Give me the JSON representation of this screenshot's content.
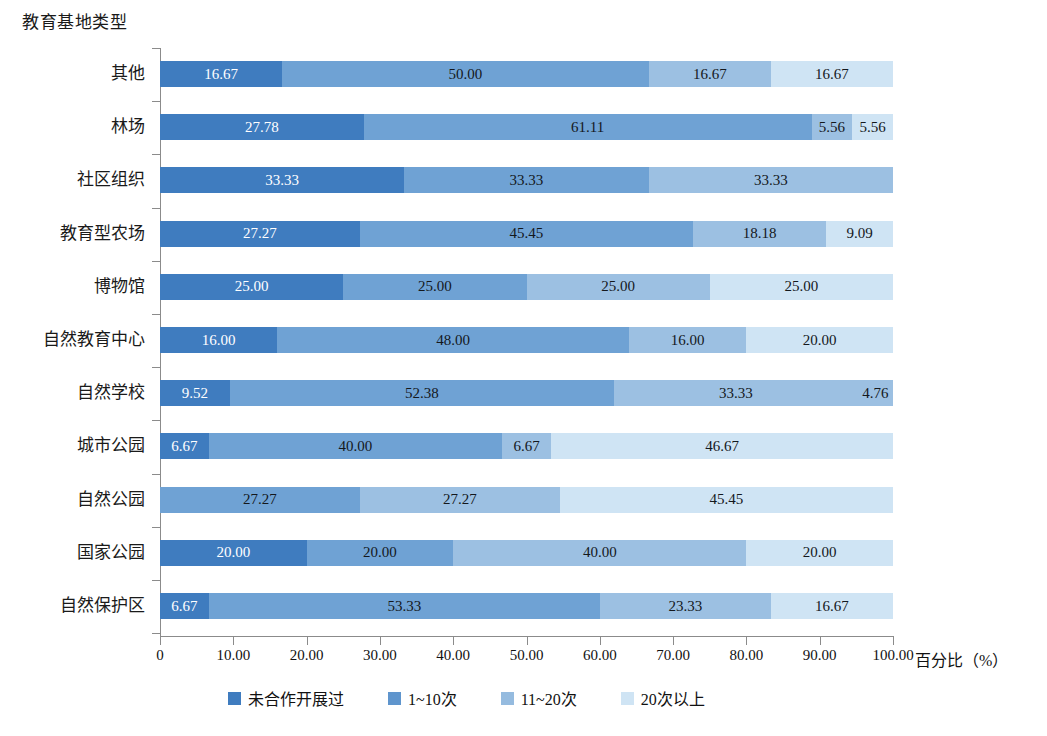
{
  "axis_titles": {
    "y": "教育基地类型",
    "x": "百分比（%）"
  },
  "legend": {
    "items": [
      {
        "label": "未合作开展过",
        "color": "#3f7cbf"
      },
      {
        "label": "1~10次",
        "color": "#5f95cd"
      },
      {
        "label": "11~20次",
        "color": "#95bbdf"
      },
      {
        "label": "20次以上",
        "color": "#cfe4f4"
      }
    ]
  },
  "x_axis": {
    "ticks": [
      "0",
      "10.00",
      "20.00",
      "30.00",
      "40.00",
      "50.00",
      "60.00",
      "70.00",
      "80.00",
      "90.00",
      "100.00"
    ],
    "min": 0,
    "max": 100
  },
  "chart_data": {
    "type": "bar",
    "orientation": "horizontal",
    "stacked": true,
    "title": "",
    "xlabel": "百分比（%）",
    "ylabel": "教育基地类型",
    "xlim": [
      0,
      100
    ],
    "grid": false,
    "legend_position": "bottom",
    "series": [
      {
        "name": "未合作开展过",
        "color": "#3f7cbf"
      },
      {
        "name": "1~10次",
        "color": "#5f95cd"
      },
      {
        "name": "11~20次",
        "color": "#95bbdf"
      },
      {
        "name": "20次以上",
        "color": "#cfe4f4"
      }
    ],
    "categories": [
      "其他",
      "林场",
      "社区组织",
      "教育型农场",
      "博物馆",
      "自然教育中心",
      "自然学校",
      "城市公园",
      "自然公园",
      "国家公园",
      "自然保护区"
    ],
    "rows": [
      {
        "category": "其他",
        "segments": [
          {
            "series": "未合作开展过",
            "value": 16.67,
            "label": "16.67",
            "color": "#3f7cbf",
            "label_color": "light"
          },
          {
            "series": "1~10次",
            "value": 50.0,
            "label": "50.00",
            "color": "#6fa2d4",
            "label_color": "dark"
          },
          {
            "series": "11~20次",
            "value": 16.67,
            "label": "16.67",
            "color": "#9cc0e2",
            "label_color": "dark"
          },
          {
            "series": "20次以上",
            "value": 16.67,
            "label": "16.67",
            "color": "#cfe4f4",
            "label_color": "dark"
          }
        ]
      },
      {
        "category": "林场",
        "segments": [
          {
            "series": "未合作开展过",
            "value": 27.78,
            "label": "27.78",
            "color": "#3f7cbf",
            "label_color": "light"
          },
          {
            "series": "1~10次",
            "value": 61.11,
            "label": "61.11",
            "color": "#6fa2d4",
            "label_color": "dark"
          },
          {
            "series": "11~20次",
            "value": 5.56,
            "label": "5.56",
            "color": "#9cc0e2",
            "label_color": "dark"
          },
          {
            "series": "20次以上",
            "value": 5.56,
            "label": "5.56",
            "color": "#cfe4f4",
            "label_color": "dark"
          }
        ]
      },
      {
        "category": "社区组织",
        "segments": [
          {
            "series": "未合作开展过",
            "value": 33.33,
            "label": "33.33",
            "color": "#3f7cbf",
            "label_color": "light"
          },
          {
            "series": "1~10次",
            "value": 33.33,
            "label": "33.33",
            "color": "#6fa2d4",
            "label_color": "dark"
          },
          {
            "series": "11~20次",
            "value": 33.33,
            "label": "33.33",
            "color": "#9cc0e2",
            "label_color": "dark"
          }
        ]
      },
      {
        "category": "教育型农场",
        "segments": [
          {
            "series": "未合作开展过",
            "value": 27.27,
            "label": "27.27",
            "color": "#3f7cbf",
            "label_color": "light"
          },
          {
            "series": "1~10次",
            "value": 45.45,
            "label": "45.45",
            "color": "#6fa2d4",
            "label_color": "dark"
          },
          {
            "series": "11~20次",
            "value": 18.18,
            "label": "18.18",
            "color": "#9cc0e2",
            "label_color": "dark"
          },
          {
            "series": "20次以上",
            "value": 9.09,
            "label": "9.09",
            "color": "#cfe4f4",
            "label_color": "dark"
          }
        ]
      },
      {
        "category": "博物馆",
        "segments": [
          {
            "series": "未合作开展过",
            "value": 25.0,
            "label": "25.00",
            "color": "#3f7cbf",
            "label_color": "light"
          },
          {
            "series": "1~10次",
            "value": 25.0,
            "label": "25.00",
            "color": "#6fa2d4",
            "label_color": "dark"
          },
          {
            "series": "11~20次",
            "value": 25.0,
            "label": "25.00",
            "color": "#9cc0e2",
            "label_color": "dark"
          },
          {
            "series": "20次以上",
            "value": 25.0,
            "label": "25.00",
            "color": "#cfe4f4",
            "label_color": "dark"
          }
        ]
      },
      {
        "category": "自然教育中心",
        "segments": [
          {
            "series": "未合作开展过",
            "value": 16.0,
            "label": "16.00",
            "color": "#3f7cbf",
            "label_color": "light"
          },
          {
            "series": "1~10次",
            "value": 48.0,
            "label": "48.00",
            "color": "#6fa2d4",
            "label_color": "dark"
          },
          {
            "series": "11~20次",
            "value": 16.0,
            "label": "16.00",
            "color": "#9cc0e2",
            "label_color": "dark"
          },
          {
            "series": "20次以上",
            "value": 20.0,
            "label": "20.00",
            "color": "#cfe4f4",
            "label_color": "dark"
          }
        ]
      },
      {
        "category": "自然学校",
        "segments": [
          {
            "series": "未合作开展过",
            "value": 9.52,
            "label": "9.52",
            "color": "#3f7cbf",
            "label_color": "light"
          },
          {
            "series": "1~10次",
            "value": 52.38,
            "label": "52.38",
            "color": "#6fa2d4",
            "label_color": "dark"
          },
          {
            "series": "11~20次",
            "value": 33.33,
            "label": "33.33",
            "color": "#9cc0e2",
            "label_color": "dark"
          },
          {
            "series": "20次以上",
            "value": 4.76,
            "label": "4.76",
            "color": "#9cc0e2",
            "label_color": "dark"
          }
        ]
      },
      {
        "category": "城市公园",
        "segments": [
          {
            "series": "未合作开展过",
            "value": 6.67,
            "label": "6.67",
            "color": "#3f7cbf",
            "label_color": "light"
          },
          {
            "series": "1~10次",
            "value": 40.0,
            "label": "40.00",
            "color": "#6fa2d4",
            "label_color": "dark"
          },
          {
            "series": "11~20次",
            "value": 6.67,
            "label": "6.67",
            "color": "#9cc0e2",
            "label_color": "dark"
          },
          {
            "series": "20次以上",
            "value": 46.67,
            "label": "46.67",
            "color": "#cfe4f4",
            "label_color": "dark"
          }
        ]
      },
      {
        "category": "自然公园",
        "segments": [
          {
            "series": "未合作开展过",
            "value": 27.27,
            "label": "27.27",
            "color": "#6fa2d4",
            "label_color": "dark"
          },
          {
            "series": "1~10次",
            "value": 27.27,
            "label": "27.27",
            "color": "#9cc0e2",
            "label_color": "dark"
          },
          {
            "series": "11~20次",
            "value": 45.45,
            "label": "45.45",
            "color": "#cfe4f4",
            "label_color": "dark"
          }
        ]
      },
      {
        "category": "国家公园",
        "segments": [
          {
            "series": "未合作开展过",
            "value": 20.0,
            "label": "20.00",
            "color": "#3f7cbf",
            "label_color": "light"
          },
          {
            "series": "1~10次",
            "value": 20.0,
            "label": "20.00",
            "color": "#6fa2d4",
            "label_color": "dark"
          },
          {
            "series": "11~20次",
            "value": 40.0,
            "label": "40.00",
            "color": "#9cc0e2",
            "label_color": "dark"
          },
          {
            "series": "20次以上",
            "value": 20.0,
            "label": "20.00",
            "color": "#cfe4f4",
            "label_color": "dark"
          }
        ]
      },
      {
        "category": "自然保护区",
        "segments": [
          {
            "series": "未合作开展过",
            "value": 6.67,
            "label": "6.67",
            "color": "#3f7cbf",
            "label_color": "light"
          },
          {
            "series": "1~10次",
            "value": 53.33,
            "label": "53.33",
            "color": "#6fa2d4",
            "label_color": "dark"
          },
          {
            "series": "11~20次",
            "value": 23.33,
            "label": "23.33",
            "color": "#9cc0e2",
            "label_color": "dark"
          },
          {
            "series": "20次以上",
            "value": 16.67,
            "label": "16.67",
            "color": "#cfe4f4",
            "label_color": "dark"
          }
        ]
      }
    ]
  }
}
